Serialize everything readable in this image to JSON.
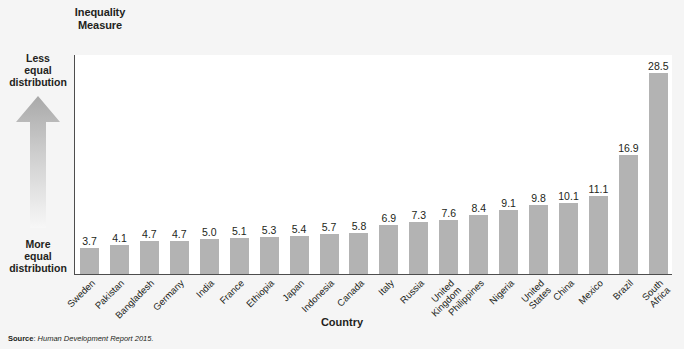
{
  "axis_titles": {
    "y": "Inequality\nMeasure",
    "x": "Country"
  },
  "direction": {
    "top_label": "Less\nequal\ndistribution",
    "bottom_label": "More\nequal\ndistribution",
    "arrow_icon": "up-arrow-gradient-icon"
  },
  "source": {
    "label": "Source",
    "separator": ": ",
    "text": "Human Development Report 2015."
  },
  "colors": {
    "bar": "#b3b3b3",
    "axis": "#4d4d4d",
    "page_background": "#f5f5f5",
    "plot_background": "#ffffff",
    "text": "#231f20"
  },
  "chart_data": {
    "type": "bar",
    "title": "",
    "xlabel": "Country",
    "ylabel": "Inequality Measure",
    "ylim": [
      0,
      31
    ],
    "grid": false,
    "legend": "none",
    "y_tick_labels": [],
    "categories": [
      "Sweden",
      "Pakistan",
      "Bangladesh",
      "Germany",
      "India",
      "France",
      "Ethiopia",
      "Japan",
      "Indonesia",
      "Canada",
      "Italy",
      "Russia",
      "United\nKingdom",
      "Philippines",
      "Nigeria",
      "United States",
      "China",
      "Mexico",
      "Brazil",
      "South Africa"
    ],
    "values": [
      3.7,
      4.1,
      4.7,
      4.7,
      5.0,
      5.1,
      5.3,
      5.4,
      5.7,
      5.8,
      6.9,
      7.3,
      7.6,
      8.4,
      9.1,
      9.8,
      10.1,
      11.1,
      16.9,
      28.5
    ],
    "value_labels": [
      "3.7",
      "4.1",
      "4.7",
      "4.7",
      "5.0",
      "5.1",
      "5.3",
      "5.4",
      "5.7",
      "5.8",
      "6.9",
      "7.3",
      "7.6",
      "8.4",
      "9.1",
      "9.8",
      "10.1",
      "11.1",
      "16.9",
      "28.5"
    ],
    "annotations": [
      "Less equal distribution",
      "More equal distribution"
    ]
  }
}
